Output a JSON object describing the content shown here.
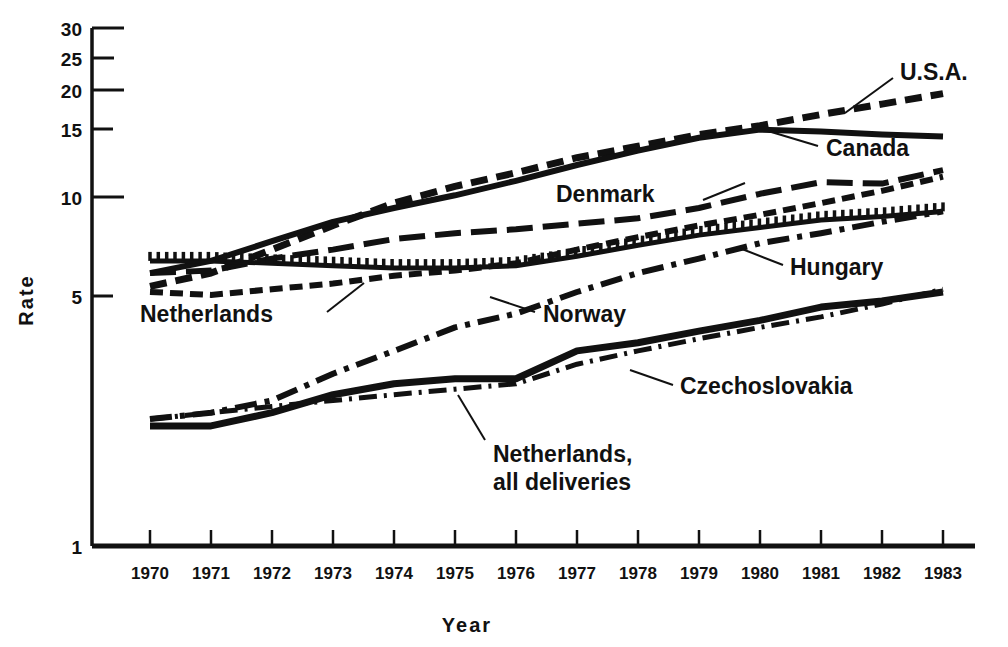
{
  "chart_data": {
    "type": "line",
    "title": "",
    "xlabel": "Year",
    "ylabel": "Rate",
    "yscale": "log",
    "ylim": [
      1,
      30
    ],
    "grid": false,
    "legend_position": "inline-annotations",
    "categories": [
      "1970",
      "1971",
      "1972",
      "1973",
      "1974",
      "1975",
      "1976",
      "1977",
      "1978",
      "1979",
      "1980",
      "1981",
      "1982",
      "1983"
    ],
    "yticks": [
      "30",
      "25",
      "20",
      "15",
      "10",
      "5",
      "1"
    ],
    "ytick_values": [
      30,
      25,
      20,
      15,
      10,
      5,
      1
    ],
    "series": [
      {
        "name": "U.S.A.",
        "style": "dashed",
        "values": [
          5.5,
          6.0,
          7.0,
          8.2,
          9.5,
          10.6,
          11.6,
          12.8,
          13.8,
          14.9,
          15.8,
          17.0,
          18.2,
          19.5
        ]
      },
      {
        "name": "Canada",
        "style": "solid",
        "values": [
          6.0,
          6.5,
          7.4,
          8.4,
          9.2,
          10.0,
          11.0,
          12.2,
          13.4,
          14.6,
          15.4,
          15.2,
          14.9,
          14.7
        ]
      },
      {
        "name": "Denmark",
        "style": "long-dash",
        "values": [
          6.0,
          6.1,
          6.6,
          7.0,
          7.5,
          7.8,
          8.0,
          8.3,
          8.6,
          9.2,
          10.1,
          10.9,
          10.8,
          11.8
        ]
      },
      {
        "name": "Netherlands",
        "style": "short-dash",
        "values": [
          5.3,
          5.2,
          5.4,
          5.6,
          5.9,
          6.1,
          6.4,
          7.0,
          7.6,
          8.2,
          8.8,
          9.5,
          10.3,
          11.3
        ]
      },
      {
        "name": "Hungary",
        "style": "comb-dotted",
        "values": [
          6.5,
          6.5,
          6.4,
          6.3,
          6.2,
          6.2,
          6.3,
          6.7,
          7.2,
          7.7,
          8.1,
          8.5,
          8.7,
          9.0
        ]
      },
      {
        "name": "Norway",
        "style": "dash-dot",
        "values": [
          2.3,
          2.4,
          2.6,
          3.1,
          3.6,
          4.2,
          4.6,
          5.3,
          6.0,
          6.6,
          7.3,
          7.8,
          8.4,
          9.0
        ]
      },
      {
        "name": "Czechoslovakia",
        "style": "dash-dot-fine",
        "values": [
          2.3,
          2.4,
          2.5,
          2.6,
          2.7,
          2.8,
          2.9,
          3.3,
          3.6,
          3.9,
          4.2,
          4.5,
          4.9,
          5.4
        ]
      },
      {
        "name": "Netherlands, all deliveries",
        "style": "thick-solid",
        "values": [
          2.2,
          2.2,
          2.4,
          2.7,
          2.9,
          3.0,
          3.0,
          3.6,
          3.8,
          4.1,
          4.4,
          4.8,
          5.0,
          5.3
        ]
      }
    ],
    "annotations": [
      {
        "label": "U.S.A.",
        "target_series": "U.S.A."
      },
      {
        "label": "Canada",
        "target_series": "Canada"
      },
      {
        "label": "Denmark",
        "target_series": "Denmark"
      },
      {
        "label": "Hungary",
        "target_series": "Hungary"
      },
      {
        "label": "Netherlands",
        "target_series": "Netherlands"
      },
      {
        "label": "Norway",
        "target_series": "Norway"
      },
      {
        "label": "Czechoslovakia",
        "target_series": "Czechoslovakia"
      },
      {
        "label": "Netherlands,",
        "target_series": "Netherlands, all deliveries"
      },
      {
        "label": "all deliveries",
        "target_series": "Netherlands, all deliveries"
      }
    ]
  },
  "labels": {
    "y_axis_title": "Rate",
    "x_axis_title": "Year",
    "usa": "U.S.A.",
    "canada": "Canada",
    "denmark": "Denmark",
    "hungary": "Hungary",
    "netherlands": "Netherlands",
    "norway": "Norway",
    "czechoslovakia": "Czechoslovakia",
    "netherlands_all_1": "Netherlands,",
    "netherlands_all_2": "all deliveries"
  },
  "yticks": {
    "t30": "30",
    "t25": "25",
    "t20": "20",
    "t15": "15",
    "t10": "10",
    "t5": "5",
    "t1": "1"
  },
  "xticks": {
    "y1970": "1970",
    "y1971": "1971",
    "y1972": "1972",
    "y1973": "1973",
    "y1974": "1974",
    "y1975": "1975",
    "y1976": "1976",
    "y1977": "1977",
    "y1978": "1978",
    "y1979": "1979",
    "y1980": "1980",
    "y1981": "1981",
    "y1982": "1982",
    "y1983": "1983"
  },
  "colors": {
    "ink": "#111111",
    "background": "#ffffff"
  }
}
